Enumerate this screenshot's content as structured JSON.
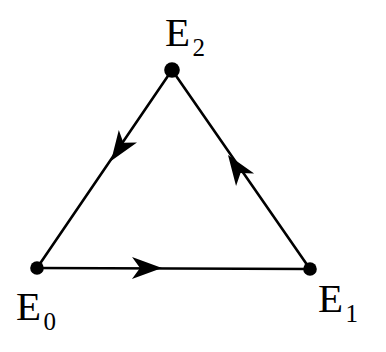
{
  "diagram": {
    "type": "directed-graph",
    "background_color": "#ffffff",
    "stroke_color": "#000000",
    "canvas": {
      "width": 386,
      "height": 352
    },
    "nodes": [
      {
        "id": "E0",
        "base": "E",
        "subscript": "0",
        "x": 37,
        "y": 268,
        "radius": 6,
        "label_position": "below-left"
      },
      {
        "id": "E1",
        "base": "E",
        "subscript": "1",
        "x": 310,
        "y": 269,
        "radius": 6,
        "label_position": "below-right"
      },
      {
        "id": "E2",
        "base": "E",
        "subscript": "2",
        "x": 172,
        "y": 70,
        "radius": 7,
        "label_position": "above"
      }
    ],
    "edges": [
      {
        "id": "edge-E0-E1",
        "from": "E0",
        "to": "E1",
        "directed": true,
        "arrow_at": {
          "x": 162,
          "y": 268
        },
        "arrow_direction": "right",
        "stroke_width": 2.6
      },
      {
        "id": "edge-E1-E2",
        "from": "E1",
        "to": "E2",
        "directed": true,
        "arrow_at": {
          "x": 228,
          "y": 155
        },
        "arrow_direction": "up-left",
        "stroke_width": 2.6
      },
      {
        "id": "edge-E2-E0",
        "from": "E2",
        "to": "E0",
        "directed": true,
        "arrow_at": {
          "x": 111,
          "y": 161
        },
        "arrow_direction": "down-left",
        "stroke_width": 2.6
      }
    ],
    "cycle_description": "E0 to E1 to E2 to E0"
  }
}
